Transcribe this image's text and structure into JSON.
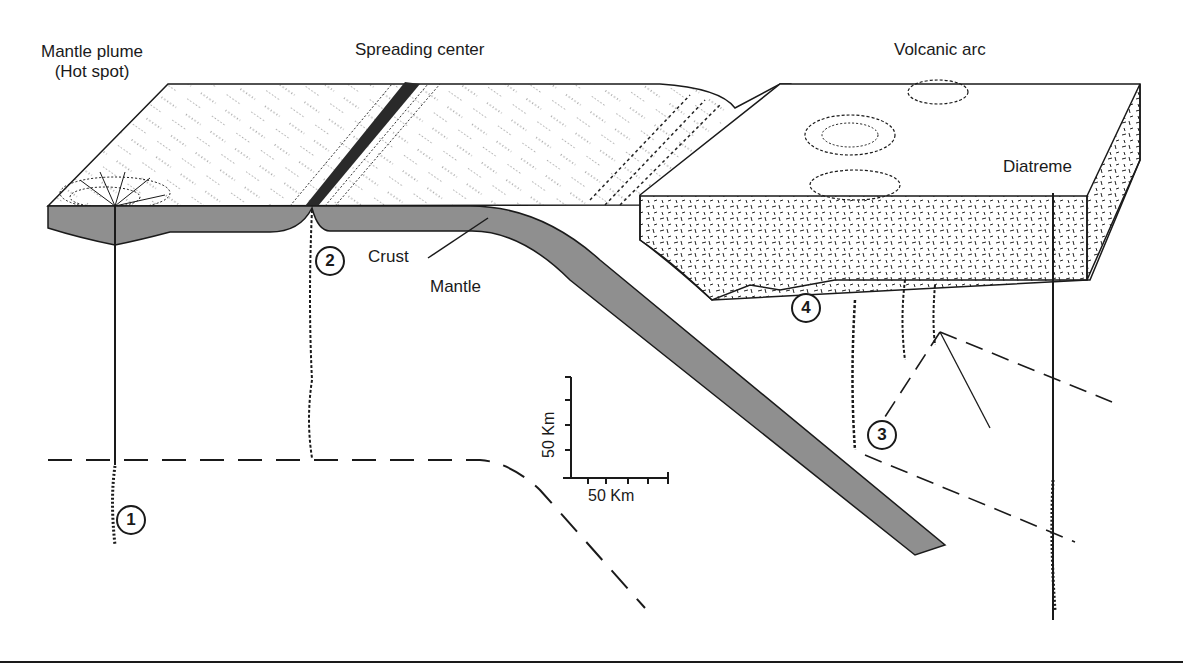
{
  "diagram": {
    "type": "geologic-block-diagram",
    "labels": {
      "mantle_plume_line1": "Mantle plume",
      "mantle_plume_line2": "(Hot spot)",
      "spreading_center": "Spreading center",
      "volcanic_arc": "Volcanic arc",
      "diatreme": "Diatreme",
      "crust": "Crust",
      "mantle": "Mantle"
    },
    "markers": [
      {
        "id": "1",
        "label": "1"
      },
      {
        "id": "2",
        "label": "2"
      },
      {
        "id": "3",
        "label": "3"
      },
      {
        "id": "4",
        "label": "4"
      }
    ],
    "scale_bar": {
      "vertical_label": "50 Km",
      "horizontal_label": "50 Km"
    },
    "colors": {
      "plate_fill": "#8f8f8f",
      "ink": "#1a1a1a",
      "background": "#ffffff"
    }
  }
}
